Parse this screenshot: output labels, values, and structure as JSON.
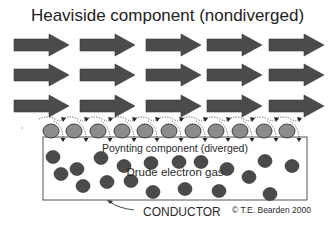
{
  "title": "Heaviside component (nondiverged)",
  "labels": {
    "poynting": "Poynting component (diverged)",
    "drude": "Drude electron gas",
    "conductor": "CONDUCTOR",
    "copyright": "© T.E. Bearden 2000"
  },
  "colors": {
    "arrow_fill": "#4b4b4b",
    "surface_charge_fill": "#8c8c8c",
    "electron_fill": "#4a4a4a",
    "outline": "#333333",
    "conductor_border": "#555555"
  },
  "energy_flow_arrows": {
    "rows_y": [
      45,
      75,
      106
    ],
    "columns_x": [
      14,
      80,
      146,
      207,
      269
    ],
    "body_length": 35,
    "head_length": 20,
    "body_half_height": 6,
    "head_half_height": 11
  },
  "surface_charges": {
    "y": 131,
    "x": [
      51,
      74,
      98,
      122,
      145,
      169,
      193,
      216,
      240,
      264,
      287
    ]
  },
  "conductor_box": {
    "x": 43,
    "y": 137,
    "width": 264,
    "height": 63
  },
  "electrons": [
    [
      53,
      157
    ],
    [
      61,
      174
    ],
    [
      77,
      169
    ],
    [
      83,
      186
    ],
    [
      101,
      158
    ],
    [
      107,
      182
    ],
    [
      124,
      166
    ],
    [
      131,
      181
    ],
    [
      151,
      163
    ],
    [
      153,
      192
    ],
    [
      179,
      162
    ],
    [
      185,
      189
    ],
    [
      201,
      162
    ],
    [
      219,
      191
    ],
    [
      227,
      169
    ],
    [
      249,
      177
    ],
    [
      265,
      161
    ],
    [
      270,
      194
    ],
    [
      292,
      166
    ]
  ]
}
